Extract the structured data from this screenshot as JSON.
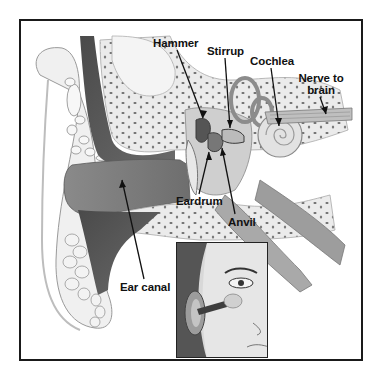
{
  "diagram": {
    "labels": [
      {
        "id": "hammer",
        "text": "Hammer"
      },
      {
        "id": "stirrup",
        "text": "Stirrup"
      },
      {
        "id": "cochlea",
        "text": "Cochlea"
      },
      {
        "id": "nerve",
        "text_line1": "Nerve to",
        "text_line2": "brain"
      },
      {
        "id": "eardrum",
        "text": "Eardrum"
      },
      {
        "id": "anvil",
        "text": "Anvil"
      },
      {
        "id": "ear_canal",
        "text": "Ear canal"
      }
    ],
    "inset": {
      "description": "Face profile showing ear canal leading inward toward eye region"
    },
    "colors": {
      "frame": "#1a1a1a",
      "label_text": "#111111",
      "tissue_dark": "#555555",
      "tissue_mid": "#9a9a9a",
      "bone_light": "#e6e6e6",
      "background": "#ffffff"
    }
  }
}
